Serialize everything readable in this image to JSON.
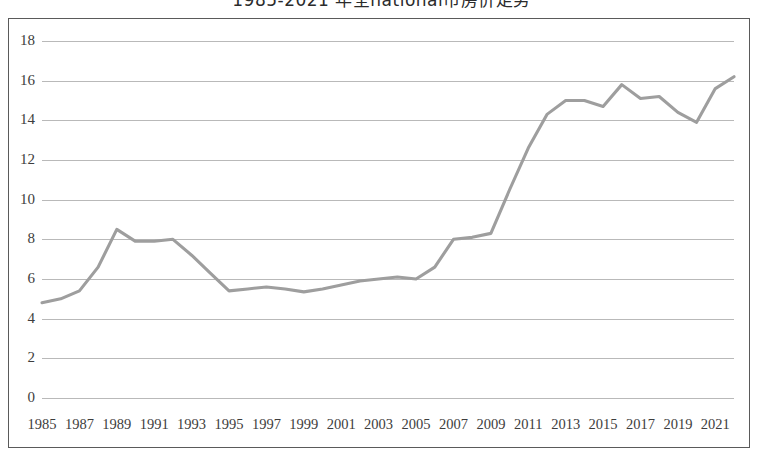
{
  "chart_data": {
    "type": "line",
    "title": "1985-2021 年全national市房价走势",
    "xlabel": "",
    "ylabel": "",
    "ylim": [
      0,
      18
    ],
    "ytick_step": 2,
    "yticks": [
      18,
      16,
      14,
      12,
      10,
      8,
      6,
      4,
      2,
      0
    ],
    "xtick_labels": [
      "1985",
      "1987",
      "1989",
      "1991",
      "1993",
      "1995",
      "1997",
      "1999",
      "2001",
      "2003",
      "2005",
      "2007",
      "2009",
      "2011",
      "2013",
      "2015",
      "2017",
      "2019",
      "2021"
    ],
    "xlim": [
      1985,
      2022
    ],
    "grid": true,
    "legend": false,
    "series_color": "#9e9e9e",
    "x": [
      1985,
      1986,
      1987,
      1988,
      1989,
      1990,
      1991,
      1992,
      1993,
      1994,
      1995,
      1996,
      1997,
      1998,
      1999,
      2000,
      2001,
      2002,
      2003,
      2004,
      2005,
      2006,
      2007,
      2008,
      2009,
      2010,
      2011,
      2012,
      2013,
      2014,
      2015,
      2016,
      2017,
      2018,
      2019,
      2020,
      2021,
      2022
    ],
    "values": [
      4.8,
      5.0,
      5.4,
      6.6,
      8.5,
      7.9,
      7.9,
      8.0,
      7.2,
      6.3,
      5.4,
      5.5,
      5.6,
      5.5,
      5.35,
      5.5,
      5.7,
      5.9,
      6.0,
      6.1,
      6.0,
      6.6,
      8.0,
      8.1,
      8.3,
      10.5,
      12.6,
      14.3,
      15.0,
      15.0,
      14.7,
      15.8,
      15.1,
      15.2,
      14.4,
      13.9,
      15.6,
      16.2
    ],
    "series_name": "房价"
  },
  "axes": {
    "y_axis_name": "y-axis",
    "x_axis_name": "x-axis"
  }
}
